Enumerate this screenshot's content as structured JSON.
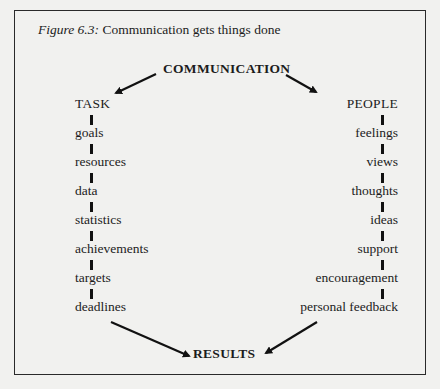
{
  "caption": {
    "label": "Figure 6.3:",
    "text": " Communication gets things done"
  },
  "diagram": {
    "top_node": "COMMUNICATION",
    "bottom_node": "RESULTS",
    "left_branch": {
      "heading": "TASK",
      "items": [
        "goals",
        "resources",
        "data",
        "statistics",
        "achievements",
        "targets",
        "deadlines"
      ]
    },
    "right_branch": {
      "heading": "PEOPLE",
      "items": [
        "feelings",
        "views",
        "thoughts",
        "ideas",
        "support",
        "encouragement",
        "personal feedback"
      ]
    },
    "edges": [
      {
        "from": "COMMUNICATION",
        "to": "TASK"
      },
      {
        "from": "COMMUNICATION",
        "to": "PEOPLE"
      },
      {
        "from": "deadlines",
        "to": "RESULTS"
      },
      {
        "from": "personal feedback",
        "to": "RESULTS"
      }
    ]
  }
}
